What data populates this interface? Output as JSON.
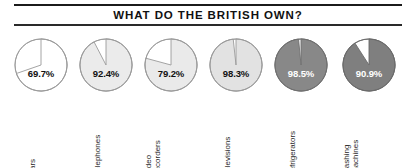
{
  "chart_data": {
    "type": "pie",
    "title": "WHAT DO THE BRITISH OWN?",
    "subtitle": "",
    "xlabel": "",
    "ylabel": "",
    "legend": "none",
    "grid": false,
    "value_suffix": "%",
    "categories": [
      "cars",
      "telephones",
      "video recorders",
      "televisions",
      "refrigerators",
      "washing machines"
    ],
    "values": [
      69.7,
      92.4,
      79.2,
      98.3,
      98.5,
      90.9
    ],
    "value_labels": [
      "69.7%",
      "92.4%",
      "79.2%",
      "98.3%",
      "98.5%",
      "90.9%"
    ],
    "remainders": [
      30.3,
      7.6,
      20.8,
      1.7,
      1.5,
      9.1
    ],
    "slices": [
      {
        "category": "cars",
        "label": "69.7%",
        "value": 69.7,
        "remainder": 30.3,
        "fill": "#ffffff",
        "remainder_fill": "#ffffff",
        "stroke": "#9a9a9a",
        "label_color": "#111111"
      },
      {
        "category": "telephones",
        "label": "92.4%",
        "value": 92.4,
        "remainder": 7.6,
        "fill": "#ebebeb",
        "remainder_fill": "#ffffff",
        "stroke": "#9a9a9a",
        "label_color": "#111111"
      },
      {
        "category": "video recorders",
        "label": "79.2%",
        "value": 79.2,
        "remainder": 20.8,
        "fill": "#eaeaea",
        "remainder_fill": "#ffffff",
        "stroke": "#9a9a9a",
        "label_color": "#111111"
      },
      {
        "category": "televisions",
        "label": "98.3%",
        "value": 98.3,
        "remainder": 1.7,
        "fill": "#e2e2e2",
        "remainder_fill": "#ffffff",
        "stroke": "#9a9a9a",
        "label_color": "#111111"
      },
      {
        "category": "refrigerators",
        "label": "98.5%",
        "value": 98.5,
        "remainder": 1.5,
        "fill": "#888888",
        "remainder_fill": "#ffffff",
        "stroke": "#6f6f6f",
        "label_color": "#ffffff"
      },
      {
        "category": "washing machines",
        "label": "90.9%",
        "value": 90.9,
        "remainder": 9.1,
        "fill": "#7f7f7f",
        "remainder_fill": "#ffffff",
        "stroke": "#6a6a6a",
        "label_color": "#ffffff"
      }
    ]
  },
  "category_lines": [
    [
      "cars"
    ],
    [
      "telephones"
    ],
    [
      "video",
      "recorders"
    ],
    [
      "televisions"
    ],
    [
      "refrigerators"
    ],
    [
      "washing",
      "machines"
    ]
  ],
  "colors": {
    "rule": "#1b1b1b",
    "title_text": "#111111",
    "category_text": "#2b2b2b",
    "background": "#ffffff"
  }
}
